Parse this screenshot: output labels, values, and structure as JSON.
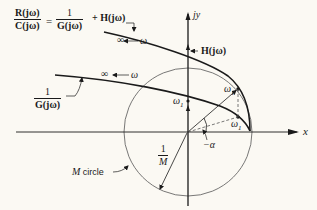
{
  "equation": {
    "lhs_num": "R(jω)",
    "lhs_den": "C(jω)",
    "equals": "=",
    "rhs_num": "1",
    "rhs_den": "G(jω)",
    "rhs_plus": "+ H(jω)"
  },
  "curve_labels": {
    "inv_g_num": "1",
    "inv_g_den": "G(jω)",
    "h_label": "H(jω)",
    "infinity": "∞",
    "omega": "ω",
    "omega1": "ω",
    "omega1_sub": "1"
  },
  "axes": {
    "x_label": "x",
    "y_label": "jy"
  },
  "circle": {
    "radius_num": "1",
    "radius_den": "M",
    "label_M": "M",
    "label_text": "circle"
  },
  "angle_label": "−α",
  "colors": {
    "ink": "#1a1a1a",
    "background": "#fbf9f3",
    "thin": "#555555"
  }
}
